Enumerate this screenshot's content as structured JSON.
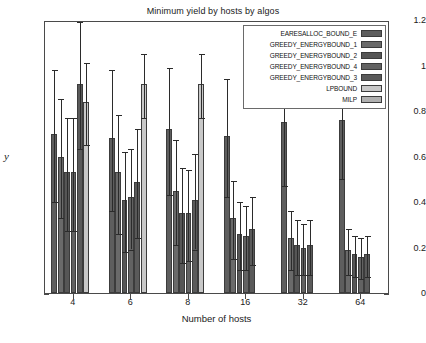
{
  "chart_data": {
    "type": "bar",
    "title": "Minimum yield by hosts by algos",
    "xlabel": "Number of hosts",
    "ylabel": "y",
    "categories": [
      "4",
      "6",
      "8",
      "16",
      "32",
      "64"
    ],
    "ylim": [
      0,
      1.2
    ],
    "yticks": [
      "0",
      "0.2",
      "0.4",
      "0.6",
      "0.8",
      "1",
      "1.2"
    ],
    "grid": false,
    "legend_position": "top-right",
    "series": [
      {
        "name": "EARESALLOC_BOUND_E",
        "color": "#5e5e5e",
        "values": [
          0.7,
          0.68,
          0.72,
          0.69,
          0.75,
          0.76
        ],
        "errors": [
          0.29,
          0.31,
          0.28,
          0.26,
          0.27,
          0.25
        ]
      },
      {
        "name": "GREEDY_ENERGYBOUND_1",
        "color": "#6a6a6a",
        "values": [
          0.6,
          0.53,
          0.45,
          0.33,
          0.24,
          0.19
        ],
        "errors": [
          0.26,
          0.26,
          0.23,
          0.17,
          0.13,
          0.1
        ]
      },
      {
        "name": "GREEDY_ENERGYBOUND_2",
        "color": "#565656",
        "values": [
          0.53,
          0.41,
          0.35,
          0.26,
          0.21,
          0.17
        ],
        "errors": [
          0.25,
          0.22,
          0.21,
          0.15,
          0.12,
          0.09
        ]
      },
      {
        "name": "GREEDY_ENERGYBOUND_4",
        "color": "#626262",
        "values": [
          0.53,
          0.42,
          0.35,
          0.25,
          0.2,
          0.16
        ],
        "errors": [
          0.25,
          0.22,
          0.2,
          0.14,
          0.11,
          0.09
        ]
      },
      {
        "name": "GREEDY_ENERGYBOUND_3",
        "color": "#5a5a5a",
        "values": [
          0.92,
          0.49,
          0.41,
          0.28,
          0.21,
          0.17
        ],
        "errors": [
          0.28,
          0.24,
          0.21,
          0.15,
          0.12,
          0.09
        ]
      },
      {
        "name": "LPBOUND",
        "color": "#c8c8c8",
        "values": [
          0.84,
          0.92,
          0.92,
          0.0,
          0.0,
          0.0
        ],
        "errors": [
          0.18,
          0.14,
          0.14,
          0.0,
          0.0,
          0.0
        ]
      },
      {
        "name": "MILP",
        "color": "#b0b0b0",
        "values": [
          0.0,
          0.0,
          0.0,
          0.0,
          0.0,
          0.0
        ],
        "errors": [
          0.0,
          0.0,
          0.0,
          0.0,
          0.0,
          0.0
        ]
      }
    ]
  }
}
